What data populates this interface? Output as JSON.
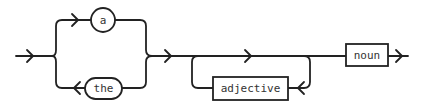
{
  "diagram": {
    "type": "railroad-syntax-diagram",
    "terminals": [
      {
        "id": "a",
        "label": "a",
        "shape": "circle"
      },
      {
        "id": "the",
        "label": "the",
        "shape": "rounded"
      }
    ],
    "nonterminals": [
      {
        "id": "adjective",
        "label": "adjective",
        "shape": "box",
        "repeatable": true
      },
      {
        "id": "noun",
        "label": "noun",
        "shape": "box"
      }
    ],
    "sequence": [
      "choice(a | the)",
      "zero-or-more(adjective)",
      "noun"
    ],
    "line_color": "#222222"
  }
}
